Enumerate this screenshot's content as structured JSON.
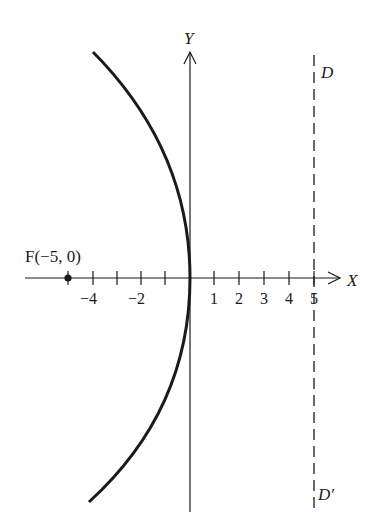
{
  "diagram": {
    "type": "parabola",
    "axes": {
      "x_label": "X",
      "y_label": "Y",
      "x_ticks": [
        {
          "value": -4,
          "label": "−4"
        },
        {
          "value": -3,
          "label": ""
        },
        {
          "value": -2,
          "label": "−2"
        },
        {
          "value": -1,
          "label": ""
        },
        {
          "value": 1,
          "label": "1"
        },
        {
          "value": 2,
          "label": "2"
        },
        {
          "value": 3,
          "label": "3"
        },
        {
          "value": 4,
          "label": "4"
        },
        {
          "value": 5,
          "label": "5"
        }
      ]
    },
    "focus": {
      "label": "F(−5, 0)",
      "x": -5,
      "y": 0
    },
    "directrix": {
      "top_label": "D",
      "bottom_label": "D′",
      "x": 5,
      "style": "dashed"
    },
    "curve": {
      "equation": "y^2 = -20x",
      "vertex": [
        0,
        0
      ]
    },
    "colors": {
      "ink": "#1a1a1a",
      "background": "#ffffff"
    }
  }
}
